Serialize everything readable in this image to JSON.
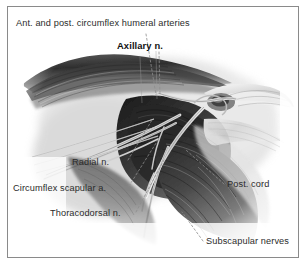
{
  "figure": {
    "type": "anatomical-illustration",
    "medium": "grayscale pencil / charcoal drawing",
    "background_color": "#ffffff",
    "frame_color": "#8a8a8a",
    "label_color": "#2b2b2b",
    "leader_line_color": "#8d8d8d"
  },
  "labels": {
    "circumflex_humeral": "Ant. and post. circumflex humeral arteries",
    "axillary": "Axillary n.",
    "radial": "Radial n.",
    "circumflex_scapular": "Circumflex scapular a.",
    "thoracodorsal": "Thoracodorsal n.",
    "post_cord": "Post. cord",
    "subscapular": "Subscapular nerves"
  }
}
